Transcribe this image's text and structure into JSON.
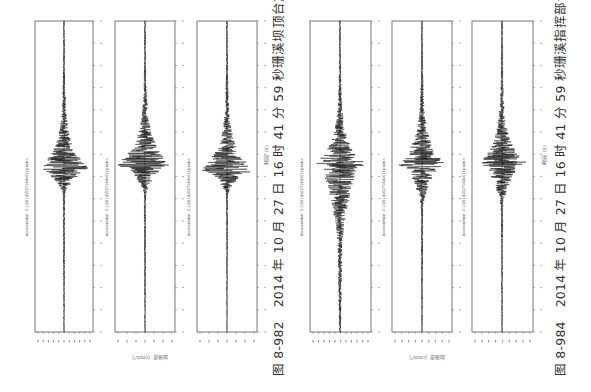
{
  "figures": [
    {
      "id": "fig-8-982",
      "number": "图 8-982",
      "caption": "2014 年 10 月 27 日 16 时 41 分 59 秒珊溪坝顶台加速度记录",
      "x_axis_label": "时间（s）",
      "y_axis_label": "加速度（cm/s²）",
      "caption_x": 268,
      "caption_y": 376,
      "ylabel_x": 168,
      "ylabel_y": 362,
      "time_label_x": 262,
      "time_label_y": 165
    },
    {
      "id": "fig-8-984",
      "number": "图 8-984",
      "caption": "2014 年 10 月 27 日 16 时 41 分 59 秒珊溪指挥部台加速度记录",
      "x_axis_label": "时间（s）",
      "y_axis_label": "加速度（cm/s²）",
      "caption_x": 550,
      "caption_y": 376,
      "ylabel_x": 445,
      "ylabel_y": 362,
      "time_label_x": 540,
      "time_label_y": 165
    }
  ],
  "chart_data": [
    {
      "type": "line",
      "title": "图 8-982 2014 年 10 月 27 日 16 时 41 分 59 秒珊溪坝顶台加速度记录",
      "xlabel": "时间（s）",
      "ylabel": "加速度（cm/s²）",
      "xlim": [
        0,
        50
      ],
      "grid": false,
      "layout_note": "page rotated 90° counter-clockwise; time axis runs vertically (0 at bottom), amplitude horizontally",
      "panels": [
        {
          "name": "Acceleration component 1",
          "frame": [
            35,
            21,
            93,
            332
          ],
          "center_x": 64,
          "peak_time_s": 26,
          "onset_time_s": 22,
          "peak_amp_px": 27,
          "pre_noise_px": 1.2,
          "ylim": [
            -2.5,
            2.5
          ],
          "tick_labels": [
            "-2.5",
            "-2",
            "-1.5",
            "-1",
            "-0.5",
            "0",
            "0.5",
            "1",
            "1.5",
            "2",
            "2.5"
          ]
        },
        {
          "name": "Acceleration component 2",
          "frame": [
            115,
            21,
            175,
            332
          ],
          "center_x": 145,
          "peak_time_s": 27,
          "onset_time_s": 22,
          "peak_amp_px": 27,
          "pre_noise_px": 1.2,
          "ylim": [
            -3,
            3
          ],
          "tick_labels": [
            "-3",
            "-2",
            "-1",
            "0",
            "1",
            "2",
            "3"
          ]
        },
        {
          "name": "Acceleration component 3",
          "frame": [
            197,
            21,
            257,
            332
          ],
          "center_x": 227,
          "peak_time_s": 26,
          "onset_time_s": 22,
          "peak_amp_px": 27,
          "pre_noise_px": 1.0,
          "ylim": [
            -1.5,
            1.5
          ],
          "tick_labels": [
            "-1.5",
            "-1",
            "-0.5",
            "0",
            "0.5",
            "1",
            "1.5"
          ]
        }
      ]
    },
    {
      "type": "line",
      "title": "图 8-984 2014 年 10 月 27 日 16 时 41 分 59 秒珊溪指挥部台加速度记录",
      "xlabel": "时间（s）",
      "ylabel": "加速度（cm/s²）",
      "xlim": [
        0,
        50
      ],
      "grid": false,
      "layout_note": "page rotated 90° counter-clockwise; time axis runs vertically (0 at bottom), amplitude horizontally",
      "panels": [
        {
          "name": "Acceleration component 1",
          "frame": [
            310,
            21,
            371,
            332
          ],
          "center_x": 340,
          "peak_time_s": 27,
          "onset_time_s": 14,
          "peak_amp_px": 24,
          "pre_noise_px": 2.5,
          "ylim": [
            -5,
            5
          ],
          "tick_labels": [
            "-5",
            "-4",
            "-3",
            "-2",
            "-1",
            "0",
            "1",
            "2",
            "3",
            "4",
            "5"
          ]
        },
        {
          "name": "Acceleration component 2",
          "frame": [
            392,
            21,
            452,
            332
          ],
          "center_x": 422,
          "peak_time_s": 27,
          "onset_time_s": 20,
          "peak_amp_px": 24,
          "pre_noise_px": 1.2,
          "ylim": [
            -4,
            4
          ],
          "tick_labels": [
            "-4",
            "-3",
            "-2",
            "-1",
            "0",
            "1",
            "2",
            "3",
            "4"
          ]
        },
        {
          "name": "Acceleration component 3",
          "frame": [
            472,
            21,
            533,
            332
          ],
          "center_x": 502,
          "peak_time_s": 27,
          "onset_time_s": 20,
          "peak_amp_px": 24,
          "pre_noise_px": 1.2,
          "ylim": [
            -4,
            4
          ],
          "tick_labels": [
            "-4",
            "-3",
            "-2",
            "-1",
            "0",
            "1",
            "2",
            "3",
            "4"
          ]
        }
      ]
    }
  ],
  "time_ticks": [
    "0",
    "5",
    "10",
    "15",
    "20",
    "25",
    "30",
    "35",
    "40",
    "45",
    "50"
  ],
  "acc_title_prefix": "Acceleration: 2.1(20141027164101) peak="
}
